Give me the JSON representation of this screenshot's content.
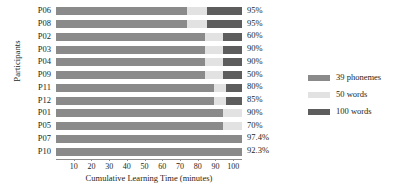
{
  "chart_data": {
    "type": "bar",
    "orientation": "horizontal",
    "stacked": true,
    "title": "",
    "xlabel": "Cumulative Learning Time (minutes)",
    "ylabel": "Participants",
    "xlim": [
      0,
      105
    ],
    "xticks": [
      10,
      20,
      30,
      40,
      50,
      60,
      70,
      80,
      90,
      100
    ],
    "grid": false,
    "legend_position": "right",
    "categories": [
      "P06",
      "P08",
      "P02",
      "P03",
      "P04",
      "P09",
      "P11",
      "P12",
      "P01",
      "P05",
      "P07",
      "P10"
    ],
    "series": [
      {
        "name": "39 phonemes",
        "color": "#8a8a8a",
        "values": [
          74,
          74,
          84,
          84,
          84,
          84,
          89,
          89,
          94,
          94,
          105,
          105
        ]
      },
      {
        "name": "50 words",
        "color": "#e2e2e2",
        "values": [
          11,
          11,
          10,
          10,
          10,
          10,
          7,
          7,
          11,
          11,
          0,
          0
        ]
      },
      {
        "name": "100 words",
        "color": "#5d5d5d",
        "values": [
          20,
          20,
          11,
          11,
          11,
          11,
          9,
          9,
          0,
          0,
          0,
          0
        ]
      }
    ],
    "annotations": {
      "label": "accuracy",
      "values": [
        "95%",
        "95%",
        "60%",
        "90%",
        "90%",
        "50%",
        "80%",
        "85%",
        "90%",
        "70%",
        "97.4%",
        "92.3%"
      ]
    }
  },
  "legend": {
    "items": [
      {
        "label": "39 phonemes",
        "color": "#8a8a8a"
      },
      {
        "label": "50 words",
        "color": "#e2e2e2"
      },
      {
        "label": "100 words",
        "color": "#5d5d5d"
      }
    ]
  }
}
